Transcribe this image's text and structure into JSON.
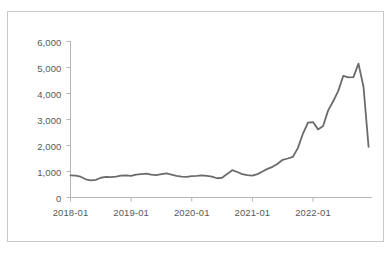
{
  "chart_data": {
    "type": "line",
    "title": "",
    "subtitle": "",
    "xlabel": "",
    "ylabel": "",
    "legend": [],
    "legend_position": "none",
    "grid": false,
    "line_color": "#6b6b6d",
    "axis_color": "#b5b5b7",
    "tick_label_color": "#58585a",
    "frame_color": "#c9c9c9",
    "background": "#ffffff",
    "xlim": [
      "2018-01",
      "2022-09"
    ],
    "ylim": [
      0,
      6000
    ],
    "y_ticks": [
      0,
      1000,
      2000,
      3000,
      4000,
      5000,
      6000
    ],
    "y_tick_labels": [
      "0",
      "1,000",
      "2,000",
      "3,000",
      "4,000",
      "5,000",
      "6,000"
    ],
    "x_ticks": [
      "2018-01",
      "2019-01",
      "2020-01",
      "2021-01",
      "2022-01"
    ],
    "x_tick_labels": [
      "2018-01",
      "2019-01",
      "2020-01",
      "2021-01",
      "2022-01"
    ],
    "x": [
      "2018-01",
      "2018-02",
      "2018-03",
      "2018-04",
      "2018-05",
      "2018-06",
      "2018-07",
      "2018-08",
      "2018-09",
      "2018-10",
      "2018-11",
      "2018-12",
      "2019-01",
      "2019-02",
      "2019-03",
      "2019-04",
      "2019-05",
      "2019-06",
      "2019-07",
      "2019-08",
      "2019-09",
      "2019-10",
      "2019-11",
      "2019-12",
      "2020-01",
      "2020-02",
      "2020-03",
      "2020-04",
      "2020-05",
      "2020-06",
      "2020-07",
      "2020-08",
      "2020-09",
      "2020-10",
      "2020-11",
      "2020-12",
      "2021-01",
      "2021-02",
      "2021-03",
      "2021-04",
      "2021-05",
      "2021-06",
      "2021-07",
      "2021-08",
      "2021-09",
      "2021-10",
      "2021-11",
      "2021-12",
      "2022-01",
      "2022-02",
      "2022-03",
      "2022-04",
      "2022-05",
      "2022-06",
      "2022-07",
      "2022-08"
    ],
    "values": [
      850,
      840,
      800,
      700,
      660,
      680,
      760,
      790,
      780,
      800,
      840,
      850,
      830,
      880,
      900,
      920,
      880,
      860,
      900,
      930,
      880,
      830,
      800,
      790,
      820,
      830,
      850,
      830,
      800,
      740,
      760,
      900,
      1050,
      980,
      900,
      860,
      840,
      900,
      1000,
      1100,
      1180,
      1300,
      1450,
      1500,
      1560,
      1900,
      2450,
      2880,
      2900,
      2620,
      2750,
      3350,
      3700,
      4100,
      4680,
      4620
    ],
    "values_extra": [
      {
        "x": "2022-03",
        "y": 4630
      },
      {
        "x": "2022-05",
        "y": 5150
      },
      {
        "x": "2022-07",
        "y": 4250
      },
      {
        "x": "2022-09",
        "y": 1950
      }
    ],
    "series": [
      {
        "name": "series-1",
        "color": "#6b6b6d",
        "line_width": 1.8,
        "markers": false
      }
    ],
    "notes": {
      "min_value": 660,
      "max_value": 5150,
      "first_value": 850,
      "last_value": 1950,
      "peak_x": "2022-01"
    }
  }
}
